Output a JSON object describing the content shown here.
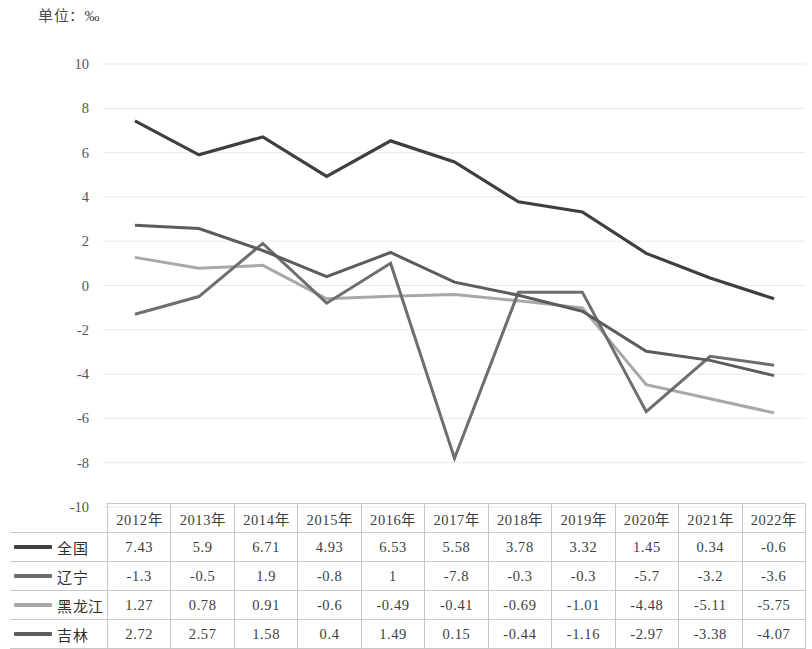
{
  "unit_caption": "单位：‰",
  "chart_data": {
    "type": "line",
    "title": "",
    "subtitle": "",
    "xlabel": "",
    "ylabel": "",
    "unit": "‰",
    "grid": true,
    "legend_position": "table-left",
    "ylim": [
      -10,
      10
    ],
    "ytick_step": 2,
    "ytick_labels": [
      "10",
      "8",
      "6",
      "4",
      "2",
      "0",
      "-2",
      "-4",
      "-6",
      "-8",
      "-10"
    ],
    "ytick_values": [
      10,
      8,
      6,
      4,
      2,
      0,
      -2,
      -4,
      -6,
      -8,
      -10
    ],
    "categories": [
      "2012年",
      "2013年",
      "2014年",
      "2015年",
      "2016年",
      "2017年",
      "2018年",
      "2019年",
      "2020年",
      "2021年",
      "2022年"
    ],
    "series": [
      {
        "name": "全国",
        "color": "#3f3f3f",
        "values": [
          7.43,
          5.9,
          6.71,
          4.93,
          6.53,
          5.58,
          3.78,
          3.32,
          1.45,
          0.34,
          -0.6
        ]
      },
      {
        "name": "辽宁",
        "color": "#6e6e6e",
        "values": [
          -1.3,
          -0.5,
          1.9,
          -0.8,
          1,
          -7.8,
          -0.3,
          -0.3,
          -5.7,
          -3.2,
          -3.6
        ]
      },
      {
        "name": "黑龙江",
        "color": "#a8a8a8",
        "values": [
          1.27,
          0.78,
          0.91,
          -0.6,
          -0.49,
          -0.41,
          -0.69,
          -1.01,
          -4.48,
          -5.11,
          -5.75
        ]
      },
      {
        "name": "吉林",
        "color": "#5c5c5c",
        "values": [
          2.72,
          2.57,
          1.58,
          0.4,
          1.49,
          0.15,
          -0.44,
          -1.16,
          -2.97,
          -3.38,
          -4.07
        ]
      }
    ]
  },
  "table": {
    "corner_label": "",
    "column_headers": [
      "2012年",
      "2013年",
      "2014年",
      "2015年",
      "2016年",
      "2017年",
      "2018年",
      "2019年",
      "2020年",
      "2021年",
      "2022年"
    ],
    "rows": [
      {
        "label": "全国",
        "color": "#3f3f3f",
        "cells": [
          "7.43",
          "5.9",
          "6.71",
          "4.93",
          "6.53",
          "5.58",
          "3.78",
          "3.32",
          "1.45",
          "0.34",
          "-0.6"
        ]
      },
      {
        "label": "辽宁",
        "color": "#6e6e6e",
        "cells": [
          "-1.3",
          "-0.5",
          "1.9",
          "-0.8",
          "1",
          "-7.8",
          "-0.3",
          "-0.3",
          "-5.7",
          "-3.2",
          "-3.6"
        ]
      },
      {
        "label": "黑龙江",
        "color": "#a8a8a8",
        "cells": [
          "1.27",
          "0.78",
          "0.91",
          "-0.6",
          "-0.49",
          "-0.41",
          "-0.69",
          "-1.01",
          "-4.48",
          "-5.11",
          "-5.75"
        ]
      },
      {
        "label": "吉林",
        "color": "#5c5c5c",
        "cells": [
          "2.72",
          "2.57",
          "1.58",
          "0.4",
          "1.49",
          "0.15",
          "-0.44",
          "-1.16",
          "-2.97",
          "-3.38",
          "-4.07"
        ]
      }
    ]
  },
  "style": {
    "gridline_color": "#e9e9e9",
    "table_border_color": "#c8c8c8",
    "text_color": "#3d3d3d"
  }
}
